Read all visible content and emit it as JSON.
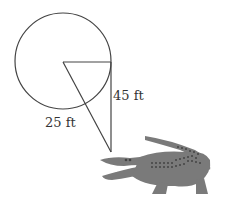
{
  "diagram": {
    "labels": {
      "height": "45 ft",
      "radius": "25 ft"
    },
    "colors": {
      "line": "#444444",
      "alligator": "#7a7a7a",
      "spots": "#444444"
    },
    "shapes": {
      "circle": {
        "cx": 63,
        "cy": 61,
        "r": 48
      },
      "triangle": {
        "center": [
          63,
          62
        ],
        "right_top": [
          111,
          62
        ],
        "bottom": [
          111,
          152
        ]
      }
    },
    "icons": [
      "alligator-icon"
    ]
  }
}
